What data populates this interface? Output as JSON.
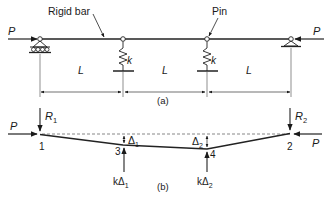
{
  "figure": {
    "panel_a": {
      "caption": "(a)",
      "callouts": {
        "rigid_bar": "Rigid bar",
        "pin": "Pin"
      },
      "load_left": "P",
      "load_right": "P",
      "spring_1_label": "k",
      "spring_2_label": "k",
      "span_labels": [
        "L",
        "L",
        "L"
      ]
    },
    "panel_b": {
      "caption": "(b)",
      "load_left": "P",
      "load_right": "P",
      "reaction_1": {
        "symbol": "R",
        "sub": "1"
      },
      "reaction_2": {
        "symbol": "R",
        "sub": "2"
      },
      "node_labels": {
        "n1": "1",
        "n2": "2",
        "n3": "3",
        "n4": "4"
      },
      "delta_1": {
        "symbol": "Δ",
        "sub": "1"
      },
      "delta_2": {
        "symbol": "Δ",
        "sub": "2"
      },
      "spring_force_1": {
        "prefix": "kΔ",
        "sub": "1"
      },
      "spring_force_2": {
        "prefix": "kΔ",
        "sub": "2"
      }
    },
    "colors": {
      "ink": "#1a1a1a",
      "line": "#333333",
      "dash": "#555555"
    }
  }
}
